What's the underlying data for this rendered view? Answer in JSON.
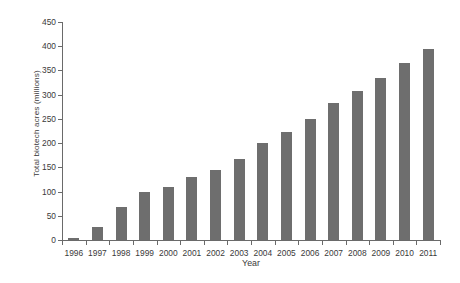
{
  "chart_data": {
    "type": "bar",
    "title": "",
    "xlabel": "Year",
    "ylabel": "Total biotech acres (millions)",
    "categories": [
      "1996",
      "1997",
      "1998",
      "1999",
      "2000",
      "2001",
      "2002",
      "2003",
      "2004",
      "2005",
      "2006",
      "2007",
      "2008",
      "2009",
      "2010",
      "2011"
    ],
    "values": [
      4,
      27,
      69,
      100,
      109,
      130,
      145,
      167,
      200,
      222,
      250,
      282,
      308,
      335,
      365,
      395
    ],
    "ylim": [
      0,
      450
    ],
    "ytick_step": 50,
    "yticks": [
      0,
      50,
      100,
      150,
      200,
      250,
      300,
      350,
      400,
      450
    ],
    "ytick_labels": [
      "0",
      "50",
      "100",
      "150",
      "200",
      "250",
      "300",
      "350",
      "400",
      "450"
    ],
    "grid": false,
    "legend": null,
    "bar_color": "#6e6e6e",
    "axis_color": "#6a6a6a",
    "background": "#ffffff"
  }
}
